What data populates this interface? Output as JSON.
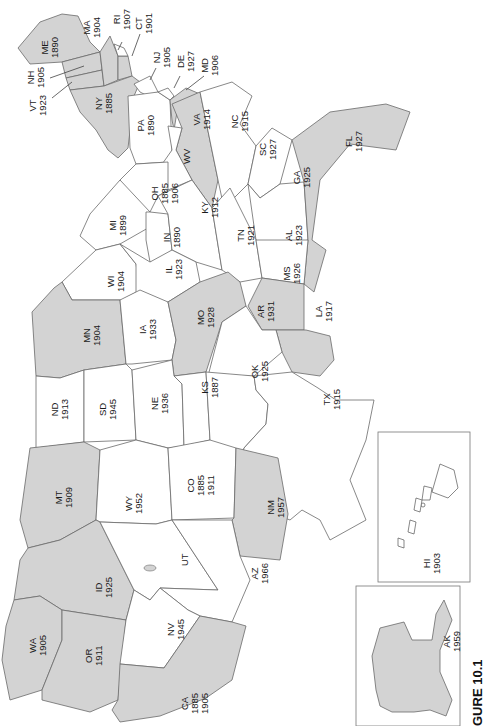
{
  "map": {
    "orientation": "rotated 90 degrees clockwise (north at left)",
    "legend_note": "Shaded states vs. unshaded states",
    "colors": {
      "shaded": "#d3d3d3",
      "unshaded": "#ffffff",
      "border": "#6a6a6a"
    },
    "caption": "GURE 10.1",
    "states": [
      {
        "abbr": "ME",
        "years": [
          "1890"
        ],
        "shaded": true
      },
      {
        "abbr": "NH",
        "years": [
          "1905"
        ],
        "shaded": true
      },
      {
        "abbr": "VT",
        "years": [
          "1923"
        ],
        "shaded": true
      },
      {
        "abbr": "MA",
        "years": [
          "1904"
        ],
        "shaded": true
      },
      {
        "abbr": "RI",
        "years": [
          "1907"
        ],
        "shaded": false
      },
      {
        "abbr": "CT",
        "years": [
          "1901"
        ],
        "shaded": false
      },
      {
        "abbr": "NY",
        "years": [
          "1885"
        ],
        "shaded": true
      },
      {
        "abbr": "NJ",
        "years": [
          "1905"
        ],
        "shaded": false
      },
      {
        "abbr": "DE",
        "years": [
          "1927"
        ],
        "shaded": false
      },
      {
        "abbr": "MD",
        "years": [
          "1906"
        ],
        "shaded": true
      },
      {
        "abbr": "PA",
        "years": [
          "1890"
        ],
        "shaded": false
      },
      {
        "abbr": "VA",
        "years": [
          "1914"
        ],
        "shaded": true
      },
      {
        "abbr": "WV",
        "years": [],
        "shaded": false
      },
      {
        "abbr": "NC",
        "years": [
          "1915"
        ],
        "shaded": false
      },
      {
        "abbr": "SC",
        "years": [
          "1927"
        ],
        "shaded": false
      },
      {
        "abbr": "GA",
        "years": [
          "1925"
        ],
        "shaded": false
      },
      {
        "abbr": "FL",
        "years": [
          "1927"
        ],
        "shaded": true
      },
      {
        "abbr": "OH",
        "years": [
          "1885",
          "1906"
        ],
        "shaded": false
      },
      {
        "abbr": "MI",
        "years": [
          "1899"
        ],
        "shaded": false
      },
      {
        "abbr": "IN",
        "years": [
          "1890"
        ],
        "shaded": false
      },
      {
        "abbr": "KY",
        "years": [
          "1912"
        ],
        "shaded": false
      },
      {
        "abbr": "TN",
        "years": [
          "1921"
        ],
        "shaded": false
      },
      {
        "abbr": "AL",
        "years": [
          "1923"
        ],
        "shaded": false
      },
      {
        "abbr": "MS",
        "years": [
          "1926"
        ],
        "shaded": true
      },
      {
        "abbr": "WI",
        "years": [
          "1904"
        ],
        "shaded": false
      },
      {
        "abbr": "IL",
        "years": [
          "1923"
        ],
        "shaded": false
      },
      {
        "abbr": "MN",
        "years": [
          "1904"
        ],
        "shaded": true
      },
      {
        "abbr": "IA",
        "years": [
          "1933"
        ],
        "shaded": false
      },
      {
        "abbr": "MO",
        "years": [
          "1928"
        ],
        "shaded": true
      },
      {
        "abbr": "AR",
        "years": [
          "1931"
        ],
        "shaded": false
      },
      {
        "abbr": "LA",
        "years": [
          "1917"
        ],
        "shaded": true
      },
      {
        "abbr": "ND",
        "years": [
          "1913"
        ],
        "shaded": false
      },
      {
        "abbr": "SD",
        "years": [
          "1945"
        ],
        "shaded": false
      },
      {
        "abbr": "NE",
        "years": [
          "1936"
        ],
        "shaded": false
      },
      {
        "abbr": "KS",
        "years": [
          "1887"
        ],
        "shaded": false
      },
      {
        "abbr": "OK",
        "years": [
          "1925"
        ],
        "shaded": false
      },
      {
        "abbr": "TX",
        "years": [
          "1915"
        ],
        "shaded": false
      },
      {
        "abbr": "MT",
        "years": [
          "1909"
        ],
        "shaded": true
      },
      {
        "abbr": "WY",
        "years": [
          "1952"
        ],
        "shaded": false
      },
      {
        "abbr": "CO",
        "years": [
          "1885",
          "1911"
        ],
        "shaded": false
      },
      {
        "abbr": "NM",
        "years": [
          "1957"
        ],
        "shaded": true
      },
      {
        "abbr": "ID",
        "years": [
          "1925"
        ],
        "shaded": true
      },
      {
        "abbr": "UT",
        "years": [],
        "shaded": false
      },
      {
        "abbr": "AZ",
        "years": [
          "1966"
        ],
        "shaded": false
      },
      {
        "abbr": "WA",
        "years": [
          "1905"
        ],
        "shaded": true
      },
      {
        "abbr": "OR",
        "years": [
          "1911"
        ],
        "shaded": true
      },
      {
        "abbr": "NV",
        "years": [
          "1945"
        ],
        "shaded": false
      },
      {
        "abbr": "CA",
        "years": [
          "1885",
          "1905"
        ],
        "shaded": true
      },
      {
        "abbr": "AK",
        "years": [
          "1959"
        ],
        "shaded": true
      },
      {
        "abbr": "HI",
        "years": [
          "1903"
        ],
        "shaded": false
      }
    ]
  },
  "labels": {
    "ME": {
      "a": "ME",
      "y1": "1890"
    },
    "NH": {
      "a": "NH",
      "y1": "1905"
    },
    "VT": {
      "a": "VT",
      "y1": "1923"
    },
    "MA": {
      "a": "MA",
      "y1": "1904"
    },
    "RI": {
      "a": "RI",
      "y1": "1907"
    },
    "CT": {
      "a": "CT",
      "y1": "1901"
    },
    "NY": {
      "a": "NY",
      "y1": "1885"
    },
    "NJ": {
      "a": "NJ",
      "y1": "1905"
    },
    "DE": {
      "a": "DE",
      "y1": "1927"
    },
    "MD": {
      "a": "MD",
      "y1": "1906"
    },
    "PA": {
      "a": "PA",
      "y1": "1890"
    },
    "VA": {
      "a": "VA",
      "y1": "1914"
    },
    "WV": {
      "a": "WV"
    },
    "NC": {
      "a": "NC",
      "y1": "1915"
    },
    "SC": {
      "a": "SC",
      "y1": "1927"
    },
    "GA": {
      "a": "GA",
      "y1": "1925"
    },
    "FL": {
      "a": "FL",
      "y1": "1927"
    },
    "OH": {
      "a": "OH",
      "y1": "1885",
      "y2": "1906"
    },
    "MI": {
      "a": "MI",
      "y1": "1899"
    },
    "IN": {
      "a": "IN",
      "y1": "1890"
    },
    "KY": {
      "a": "KY",
      "y1": "1912"
    },
    "TN": {
      "a": "TN",
      "y1": "1921"
    },
    "AL": {
      "a": "AL",
      "y1": "1923"
    },
    "MS": {
      "a": "MS",
      "y1": "1926"
    },
    "WI": {
      "a": "WI",
      "y1": "1904"
    },
    "IL": {
      "a": "IL",
      "y1": "1923"
    },
    "MN": {
      "a": "MN",
      "y1": "1904"
    },
    "IA": {
      "a": "IA",
      "y1": "1933"
    },
    "MO": {
      "a": "MO",
      "y1": "1928"
    },
    "AR": {
      "a": "AR",
      "y1": "1931"
    },
    "LA": {
      "a": "LA",
      "y1": "1917"
    },
    "ND": {
      "a": "ND",
      "y1": "1913"
    },
    "SD": {
      "a": "SD",
      "y1": "1945"
    },
    "NE": {
      "a": "NE",
      "y1": "1936"
    },
    "KS": {
      "a": "KS",
      "y1": "1887"
    },
    "OK": {
      "a": "OK",
      "y1": "1925"
    },
    "TX": {
      "a": "TX",
      "y1": "1915"
    },
    "MT": {
      "a": "MT",
      "y1": "1909"
    },
    "WY": {
      "a": "WY",
      "y1": "1952"
    },
    "CO": {
      "a": "CO",
      "y1": "1885",
      "y2": "1911"
    },
    "NM": {
      "a": "NM",
      "y1": "1957"
    },
    "ID": {
      "a": "ID",
      "y1": "1925"
    },
    "UT": {
      "a": "UT"
    },
    "AZ": {
      "a": "AZ",
      "y1": "1966"
    },
    "WA": {
      "a": "WA",
      "y1": "1905"
    },
    "OR": {
      "a": "OR",
      "y1": "1911"
    },
    "NV": {
      "a": "NV",
      "y1": "1945"
    },
    "CA": {
      "a": "CA",
      "y1": "1885",
      "y2": "1905"
    },
    "AK": {
      "a": "AK",
      "y1": "1959"
    },
    "HI": {
      "a": "HI",
      "y1": "1903"
    }
  }
}
